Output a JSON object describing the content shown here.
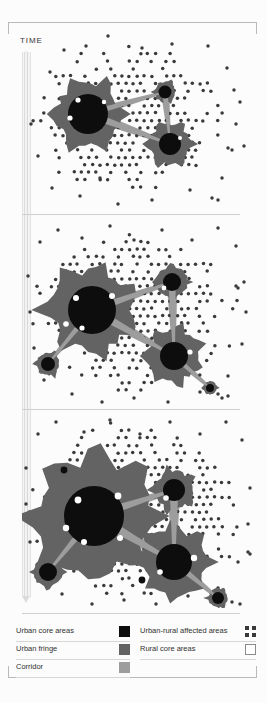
{
  "figure": {
    "time_axis_label": "TIME",
    "panel_count": 3
  },
  "legend": {
    "left": [
      {
        "label": "Urban core areas",
        "swatch": "solid-black-square",
        "color": "#0d0d0d"
      },
      {
        "label": "Urban fringe",
        "swatch": "solid-gray-square",
        "color": "#636363"
      },
      {
        "label": "Corridor",
        "swatch": "light-gray-square",
        "color": "#9d9d9d"
      }
    ],
    "right": [
      {
        "label": "Urban-rural affected areas",
        "swatch": "dot-pattern-square",
        "color": "#3a3a3a"
      },
      {
        "label": "Rural core areas",
        "swatch": "empty-outline-square",
        "color": "#ffffff"
      }
    ]
  },
  "chart_data": {
    "type": "diagram",
    "title": "",
    "colors": {
      "urban_core": "#0d0d0d",
      "urban_fringe": "#636363",
      "corridor": "#9d9d9d",
      "affected_dot": "#3a3a3a",
      "rural": "#ffffff",
      "background": "#fcfcfc",
      "rule": "#cfcfcf"
    },
    "dot_grid": {
      "spacing": 7.4,
      "radius": 1.75,
      "color": "#3a3a3a"
    },
    "panels": [
      {
        "stage": 1,
        "viewbox": [
          0,
          0,
          235,
          186
        ],
        "dot_field": [
          {
            "cx": 108,
            "cy": 92,
            "rx": 98,
            "ry": 76,
            "density": 0.78,
            "noise": 0.3
          }
        ],
        "outliers": [
          [
            28,
            44
          ],
          [
            42,
            22
          ],
          [
            64,
            18
          ],
          [
            86,
            8
          ],
          [
            120,
            20
          ],
          [
            150,
            16
          ],
          [
            186,
            18
          ],
          [
            205,
            40
          ],
          [
            212,
            62
          ],
          [
            9,
            96
          ],
          [
            16,
            128
          ],
          [
            30,
            160
          ],
          [
            58,
            168
          ],
          [
            96,
            176
          ],
          [
            130,
            172
          ],
          [
            168,
            162
          ],
          [
            200,
            150
          ],
          [
            214,
            96
          ],
          [
            218,
            74
          ],
          [
            222,
            118
          ],
          [
            206,
            120
          ],
          [
            210,
            122
          ],
          [
            190,
            170
          ],
          [
            196,
            172
          ],
          [
            78,
            150
          ]
        ],
        "cores": [
          {
            "name": "primary-core",
            "cx": 66,
            "cy": 86,
            "r": 20,
            "fringe": 33,
            "spikes": 6,
            "satellites": [
              [
                56,
                72,
                2.6
              ],
              [
                48,
                90,
                2.6
              ],
              [
                82,
                74,
                2.2
              ]
            ]
          },
          {
            "name": "secondary-core",
            "cx": 148,
            "cy": 116,
            "r": 11,
            "fringe": 21,
            "spikes": 6,
            "satellites": [
              [
                158,
                110,
                2.0
              ]
            ]
          },
          {
            "name": "tertiary-core",
            "cx": 143,
            "cy": 64,
            "r": 6.5,
            "fringe": 11,
            "spikes": 3,
            "satellites": []
          }
        ],
        "corridors": [
          {
            "from": [
              66,
              86
            ],
            "to": [
              143,
              64
            ],
            "w": 3.0
          },
          {
            "from": [
              66,
              86
            ],
            "to": [
              148,
              116
            ],
            "w": 3.6
          },
          {
            "from": [
              143,
              64
            ],
            "to": [
              148,
              116
            ],
            "w": 2.6
          }
        ]
      },
      {
        "stage": 2,
        "viewbox": [
          0,
          0,
          235,
          192
        ],
        "dot_field": [
          {
            "cx": 110,
            "cy": 96,
            "rx": 104,
            "ry": 82,
            "density": 0.84,
            "noise": 0.28
          }
        ],
        "outliers": [
          [
            18,
            26
          ],
          [
            36,
            14
          ],
          [
            60,
            22
          ],
          [
            88,
            10
          ],
          [
            112,
            24
          ],
          [
            140,
            14
          ],
          [
            170,
            24
          ],
          [
            196,
            12
          ],
          [
            214,
            30
          ],
          [
            6,
            60
          ],
          [
            8,
            96
          ],
          [
            12,
            132
          ],
          [
            22,
            164
          ],
          [
            50,
            178
          ],
          [
            80,
            186
          ],
          [
            112,
            182
          ],
          [
            146,
            186
          ],
          [
            178,
            176
          ],
          [
            206,
            160
          ],
          [
            220,
            128
          ],
          [
            224,
            96
          ],
          [
            222,
            66
          ],
          [
            196,
            178
          ],
          [
            206,
            180
          ],
          [
            200,
            182
          ],
          [
            214,
            70
          ],
          [
            216,
            72
          ]
        ],
        "cores": [
          {
            "name": "primary-core",
            "cx": 70,
            "cy": 94,
            "r": 24,
            "fringe": 41,
            "spikes": 7,
            "satellites": [
              [
                54,
                82,
                3.0
              ],
              [
                44,
                108,
                2.8
              ],
              [
                90,
                80,
                3.0
              ],
              [
                60,
                112,
                2.6
              ]
            ]
          },
          {
            "name": "secondary-core",
            "cx": 152,
            "cy": 140,
            "r": 14,
            "fringe": 26,
            "spikes": 7,
            "satellites": [
              [
                168,
                136,
                2.6
              ]
            ]
          },
          {
            "name": "tertiary-core",
            "cx": 150,
            "cy": 66,
            "r": 9,
            "fringe": 16,
            "spikes": 4,
            "satellites": [
              [
                142,
                72,
                2.4
              ]
            ]
          },
          {
            "name": "outer-core",
            "cx": 26,
            "cy": 148,
            "r": 7,
            "fringe": 12,
            "spikes": 3,
            "satellites": []
          },
          {
            "name": "edge-core",
            "cx": 188,
            "cy": 172,
            "r": 4,
            "fringe": 7,
            "spikes": 2,
            "satellites": []
          }
        ],
        "corridors": [
          {
            "from": [
              70,
              94
            ],
            "to": [
              150,
              66
            ],
            "w": 3.6
          },
          {
            "from": [
              70,
              94
            ],
            "to": [
              152,
              140
            ],
            "w": 4.4
          },
          {
            "from": [
              150,
              66
            ],
            "to": [
              152,
              140
            ],
            "w": 3.4
          },
          {
            "from": [
              70,
              94
            ],
            "to": [
              26,
              148
            ],
            "w": 3.0
          },
          {
            "from": [
              152,
              140
            ],
            "to": [
              188,
              172
            ],
            "w": 2.6
          }
        ]
      },
      {
        "stage": 3,
        "viewbox": [
          0,
          0,
          235,
          196
        ],
        "dot_field": [
          {
            "cx": 112,
            "cy": 98,
            "rx": 110,
            "ry": 88,
            "density": 0.88,
            "noise": 0.26
          }
        ],
        "outliers": [
          [
            16,
            22
          ],
          [
            34,
            10
          ],
          [
            62,
            20
          ],
          [
            88,
            8
          ],
          [
            118,
            22
          ],
          [
            148,
            10
          ],
          [
            178,
            22
          ],
          [
            204,
            10
          ],
          [
            220,
            28
          ],
          [
            4,
            56
          ],
          [
            4,
            92
          ],
          [
            8,
            130
          ],
          [
            16,
            162
          ],
          [
            40,
            182
          ],
          [
            70,
            192
          ],
          [
            102,
            188
          ],
          [
            134,
            192
          ],
          [
            166,
            184
          ],
          [
            196,
            176
          ],
          [
            216,
            150
          ],
          [
            226,
            112
          ],
          [
            228,
            76
          ],
          [
            210,
            190
          ],
          [
            218,
            192
          ],
          [
            200,
            192
          ],
          [
            226,
            140
          ],
          [
            228,
            142
          ]
        ],
        "cores": [
          {
            "name": "primary-core",
            "cx": 72,
            "cy": 104,
            "r": 30,
            "fringe": 58,
            "spikes": 8,
            "satellites": [
              [
                56,
                88,
                3.4
              ],
              [
                44,
                116,
                3.2
              ],
              [
                96,
                84,
                3.4
              ],
              [
                62,
                130,
                3.0
              ],
              [
                98,
                126,
                3.0
              ]
            ]
          },
          {
            "name": "secondary-core",
            "cx": 152,
            "cy": 150,
            "r": 18,
            "fringe": 33,
            "spikes": 8,
            "satellites": [
              [
                172,
                146,
                3.2
              ],
              [
                138,
                160,
                2.8
              ]
            ]
          },
          {
            "name": "tertiary-core",
            "cx": 152,
            "cy": 78,
            "r": 11,
            "fringe": 20,
            "spikes": 5,
            "satellites": [
              [
                144,
                86,
                2.8
              ]
            ]
          },
          {
            "name": "outer-core",
            "cx": 26,
            "cy": 160,
            "r": 9,
            "fringe": 15,
            "spikes": 4,
            "satellites": []
          },
          {
            "name": "edge-core",
            "cx": 196,
            "cy": 186,
            "r": 6,
            "fringe": 10,
            "spikes": 3,
            "satellites": []
          },
          {
            "name": "spot-core-a",
            "cx": 42,
            "cy": 58,
            "r": 3.4,
            "fringe": 0,
            "spikes": 0,
            "satellites": []
          },
          {
            "name": "spot-core-b",
            "cx": 120,
            "cy": 168,
            "r": 3.4,
            "fringe": 0,
            "spikes": 0,
            "satellites": []
          }
        ],
        "corridors": [
          {
            "from": [
              72,
              104
            ],
            "to": [
              152,
              78
            ],
            "w": 4.4
          },
          {
            "from": [
              72,
              104
            ],
            "to": [
              152,
              150
            ],
            "w": 5.2
          },
          {
            "from": [
              152,
              78
            ],
            "to": [
              152,
              150
            ],
            "w": 4.0
          },
          {
            "from": [
              72,
              104
            ],
            "to": [
              26,
              160
            ],
            "w": 3.6
          },
          {
            "from": [
              152,
              150
            ],
            "to": [
              196,
              186
            ],
            "w": 3.2
          }
        ]
      }
    ]
  }
}
